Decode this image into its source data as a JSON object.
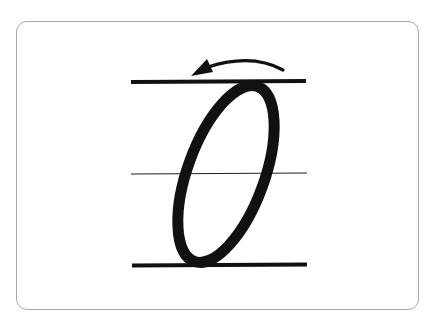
{
  "card": {
    "type": "letter-formation-card",
    "letter": "O",
    "border_color": "#a8a8a8",
    "ink_color": "#111111"
  },
  "guide_lines": [
    {
      "name": "top-line",
      "y": 82,
      "x1": 131,
      "x2": 306,
      "thickness": 4
    },
    {
      "name": "mid-line",
      "y": 174,
      "x1": 131,
      "x2": 306,
      "thickness": 1.2
    },
    {
      "name": "base-line",
      "y": 265,
      "x1": 132,
      "x2": 307,
      "thickness": 4
    }
  ],
  "letter_stroke": {
    "cx": 225,
    "cy": 174,
    "rx": 39,
    "ry": 93,
    "rotation_deg": 20,
    "stroke_width": 11
  },
  "direction_arrow": {
    "direction": "counter-clockwise",
    "from": [
      284,
      71
    ],
    "to": [
      194,
      74
    ]
  }
}
